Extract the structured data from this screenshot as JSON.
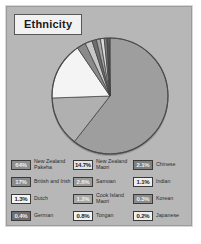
{
  "figure": {
    "title": "Ethnicity",
    "panel_color": "#b7b7b7",
    "border_color": "#9b9b9b"
  },
  "chart_data": {
    "type": "pie",
    "title": "Ethnicity",
    "xlabel": "",
    "ylabel": "",
    "units": "percent",
    "note": "Percentages sum to more than 100 because people may identify with more than one ethnicity.",
    "categories": [
      "New Zealand Pakeha",
      "New Zealand Maori",
      "British and Irish",
      "Samoan",
      "Chinese",
      "Dutch",
      "Cook Island Maori",
      "Indian",
      "Tongan",
      "German",
      "Korean",
      "Japanese"
    ],
    "values": [
      64,
      14.7,
      17,
      2.6,
      2.1,
      1.3,
      1.2,
      1.1,
      0.8,
      0.4,
      0.3,
      0.2
    ],
    "labels": [
      "64%",
      "14.7%",
      "17%",
      "2.6%",
      "2.1%",
      "1.3%",
      "1.2%",
      "1.1%",
      "0.8%",
      "0.4%",
      "0.3%",
      "0.2%"
    ],
    "slice_colors": [
      "#9e9e9e",
      "#b0b0b0",
      "#f4f4f4",
      "#8a8a8a",
      "#c8c8c8",
      "#6f6f6f",
      "#a5a5a5",
      "#dcdcdc",
      "#7d7d7d",
      "#5e5e5e",
      "#bdbdbd",
      "#909090"
    ],
    "legend_position": "bottom",
    "grid": false
  },
  "legend": {
    "items": [
      {
        "value": "64%",
        "label": "New Zealand Pakeha",
        "swatch": "#8f8f8f",
        "swatch_style": "dark"
      },
      {
        "value": "14.7%",
        "label": "New Zealand Maori",
        "swatch": "#e4e4e4",
        "swatch_style": "light"
      },
      {
        "value": "2.1%",
        "label": "Chinese",
        "swatch": "#7f7f7f",
        "swatch_style": "dark"
      },
      {
        "value": "17%",
        "label": "British and Irish",
        "swatch": "#8a8a8a",
        "swatch_style": "dark"
      },
      {
        "value": "2.6%",
        "label": "Samoan",
        "swatch": "#9a9a9a",
        "swatch_style": "dark"
      },
      {
        "value": "1.1%",
        "label": "Indian",
        "swatch": "#ededed",
        "swatch_style": "light"
      },
      {
        "value": "1.3%",
        "label": "Dutch",
        "swatch": "#f4f4f4",
        "swatch_style": "light"
      },
      {
        "value": "1.2%",
        "label": "Cook Island Maori",
        "swatch": "#a8a8a8",
        "swatch_style": "dark"
      },
      {
        "value": "0.3%",
        "label": "Korean",
        "swatch": "#8c8c8c",
        "swatch_style": "dark"
      },
      {
        "value": "0.4%",
        "label": "German",
        "swatch": "#6e6e6e",
        "swatch_style": "dark"
      },
      {
        "value": "0.8%",
        "label": "Tongan",
        "swatch": "#f2f2f2",
        "swatch_style": "light"
      },
      {
        "value": "0.2%",
        "label": "Japanese",
        "swatch": "#efefef",
        "swatch_style": "light"
      }
    ]
  }
}
